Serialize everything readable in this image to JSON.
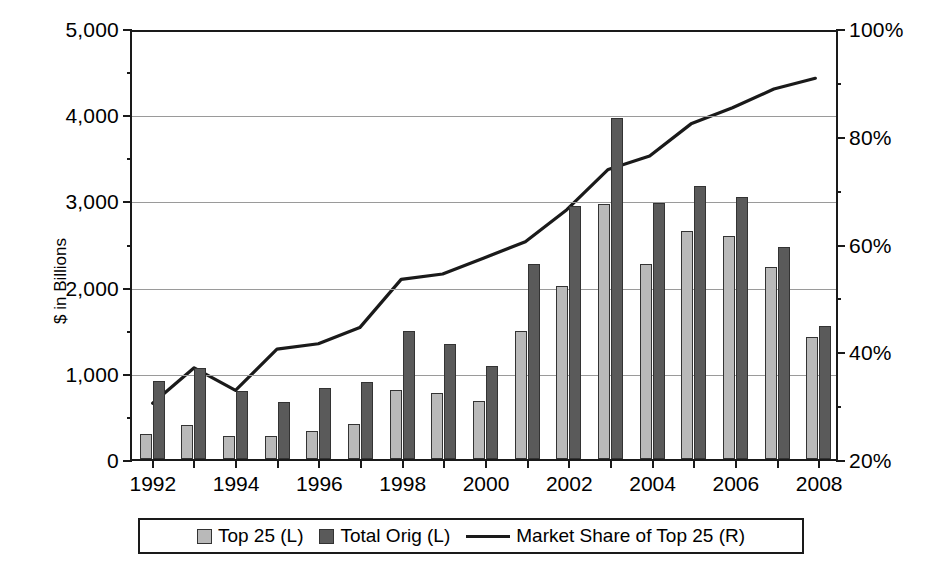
{
  "chart_data": {
    "type": "bar",
    "title": "",
    "subtitle": "",
    "xlabel": "",
    "ylabel": "$ in Billions",
    "ylabel_right": "",
    "grid": true,
    "legend_position": "bottom",
    "categories": [
      1992,
      1993,
      1994,
      1995,
      1996,
      1997,
      1998,
      1999,
      2000,
      2001,
      2002,
      2003,
      2004,
      2005,
      2006,
      2007,
      2008
    ],
    "x_tick_labels": [
      "1992",
      "",
      "1994",
      "",
      "1996",
      "",
      "1998",
      "",
      "2000",
      "",
      "2002",
      "",
      "2004",
      "",
      "2006",
      "",
      "2008"
    ],
    "ylim": [
      0,
      5000
    ],
    "y_ticks": [
      0,
      1000,
      2000,
      3000,
      4000,
      5000
    ],
    "y_tick_labels": [
      "0",
      "1,000",
      "2,000",
      "3,000",
      "4,000",
      "5,000"
    ],
    "y_minor_ticks": [
      500,
      1500,
      2500,
      3500,
      4500
    ],
    "ylim_right": [
      20,
      100
    ],
    "y_ticks_right": [
      20,
      40,
      60,
      80,
      100
    ],
    "y_tick_labels_right": [
      "20%",
      "40%",
      "60%",
      "80%",
      "100%"
    ],
    "y_minor_ticks_right": [
      30,
      50,
      70,
      90
    ],
    "series": [
      {
        "name": "Top 25 (L)",
        "kind": "bar",
        "axis": "left",
        "color": "#b9b9b9",
        "values": [
          290,
          390,
          265,
          265,
          330,
          405,
          795,
          765,
          670,
          1490,
          2005,
          2955,
          2260,
          2650,
          2590,
          2230,
          1420
        ]
      },
      {
        "name": "Total Orig (L)",
        "kind": "bar",
        "axis": "left",
        "color": "#5a5a5a",
        "values": [
          900,
          1060,
          785,
          660,
          825,
          890,
          1480,
          1330,
          1080,
          2260,
          2930,
          3960,
          2970,
          3170,
          3040,
          2465,
          1540
        ]
      },
      {
        "name": "Market Share of Top 25 (R)",
        "kind": "line",
        "axis": "right",
        "color": "#1a1a1a",
        "values": [
          30.4,
          37.0,
          32.8,
          40.5,
          41.5,
          44.5,
          53.5,
          54.5,
          57.5,
          60.5,
          66.5,
          74.0,
          76.5,
          82.5,
          85.5,
          89.0,
          91.0
        ]
      }
    ]
  },
  "legend": {
    "items": [
      {
        "label": "Top 25 (L)",
        "marker": "swatch-light"
      },
      {
        "label": "Total Orig (L)",
        "marker": "swatch-dark"
      },
      {
        "label": "Market Share of Top 25 (R)",
        "marker": "line-black"
      }
    ]
  }
}
